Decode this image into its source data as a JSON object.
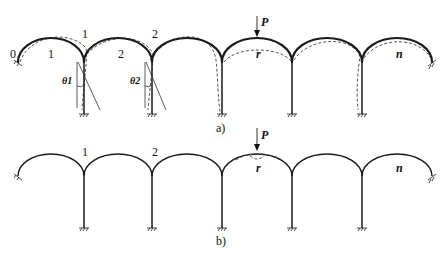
{
  "figure": {
    "panels": [
      {
        "caption": "a)",
        "load_label": "P",
        "span_labels": [
          "1",
          "2",
          "r",
          "n"
        ],
        "node_labels": [
          "0",
          "1",
          "2"
        ],
        "angle_labels": [
          "θ1",
          "θ2"
        ]
      },
      {
        "caption": "b)",
        "load_label": "P",
        "span_labels": [
          "r",
          "n"
        ],
        "node_labels": [
          "1",
          "2"
        ]
      }
    ],
    "colors": {
      "line": "#1a1a1a",
      "background": "#ffffff"
    }
  }
}
